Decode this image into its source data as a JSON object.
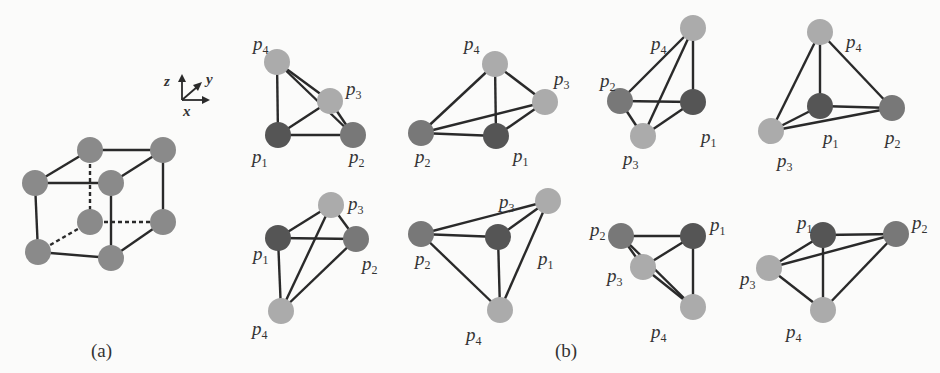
{
  "figure": {
    "panel_a": {
      "caption": "(a)",
      "axes": {
        "z": "z",
        "y": "y",
        "x": "x"
      },
      "cube_nodes": [
        {
          "id": "tbl",
          "x": 90,
          "y": 150
        },
        {
          "id": "tbr",
          "x": 163,
          "y": 150
        },
        {
          "id": "tfl",
          "x": 35,
          "y": 183
        },
        {
          "id": "tfr",
          "x": 111,
          "y": 183
        },
        {
          "id": "mbl",
          "x": 90,
          "y": 222
        },
        {
          "id": "mbr",
          "x": 163,
          "y": 222
        },
        {
          "id": "bfl",
          "x": 38,
          "y": 252
        },
        {
          "id": "bfr",
          "x": 111,
          "y": 258
        }
      ],
      "cube_color": "#8a8a8a"
    },
    "panel_b": {
      "caption": "(b)",
      "label_prefix": "p",
      "colors": {
        "p1": "#555555",
        "p2": "#787878",
        "p3": "#ababab",
        "p4": "#ababab"
      },
      "tetrahedra": [
        {
          "name": "top-1",
          "nodes": {
            "p1": [
              278,
              135
            ],
            "p2": [
              353,
              135
            ],
            "p3": [
              330,
              101
            ],
            "p4": [
              277,
              62
            ]
          },
          "labels": {
            "p1": [
              252,
              163
            ],
            "p2": [
              349,
              163
            ],
            "p3": [
              346,
              95
            ],
            "p4": [
              253,
              50
            ]
          }
        },
        {
          "name": "top-2",
          "nodes": {
            "p1": [
              496,
              136
            ],
            "p2": [
              421,
              133
            ],
            "p3": [
              545,
              102
            ],
            "p4": [
              495,
              64
            ]
          },
          "labels": {
            "p1": [
              513,
              162
            ],
            "p2": [
              415,
              163
            ],
            "p3": [
              554,
              85
            ],
            "p4": [
              464,
              50
            ]
          }
        },
        {
          "name": "top-3",
          "nodes": {
            "p1": [
              693,
              102
            ],
            "p2": [
              620,
              101
            ],
            "p3": [
              643,
              136
            ],
            "p4": [
              693,
              28
            ]
          },
          "labels": {
            "p1": [
              701,
              143
            ],
            "p2": [
              600,
              87
            ],
            "p3": [
              623,
              165
            ],
            "p4": [
              651,
              50
            ]
          }
        },
        {
          "name": "top-4",
          "nodes": {
            "p1": [
              820,
              106
            ],
            "p2": [
              892,
              108
            ],
            "p3": [
              771,
              131
            ],
            "p4": [
              820,
              32
            ]
          },
          "labels": {
            "p1": [
              823,
              144
            ],
            "p2": [
              885,
              144
            ],
            "p3": [
              777,
              167
            ],
            "p4": [
              846,
              48
            ]
          }
        },
        {
          "name": "bottom-1",
          "nodes": {
            "p1": [
              278,
              238
            ],
            "p2": [
              356,
              239
            ],
            "p3": [
              331,
              205
            ],
            "p4": [
              281,
              311
            ]
          },
          "labels": {
            "p1": [
              253,
              260
            ],
            "p2": [
              362,
              270
            ],
            "p3": [
              348,
              210
            ],
            "p4": [
              252,
              335
            ]
          }
        },
        {
          "name": "bottom-2",
          "nodes": {
            "p1": [
              498,
              237
            ],
            "p2": [
              421,
              234
            ],
            "p3": [
              548,
              201
            ],
            "p4": [
              500,
              310
            ]
          },
          "labels": {
            "p1": [
              538,
              265
            ],
            "p2": [
              415,
              265
            ],
            "p3": [
              499,
              208
            ],
            "p4": [
              466,
              341
            ]
          }
        },
        {
          "name": "bottom-3",
          "nodes": {
            "p1": [
              693,
              236
            ],
            "p2": [
              621,
              236
            ],
            "p3": [
              643,
              267
            ],
            "p4": [
              693,
              307
            ]
          },
          "labels": {
            "p1": [
              710,
              231
            ],
            "p2": [
              590,
              236
            ],
            "p3": [
              607,
              282
            ],
            "p4": [
              651,
              338
            ]
          }
        },
        {
          "name": "bottom-4",
          "nodes": {
            "p1": [
              823,
              235
            ],
            "p2": [
              896,
              234
            ],
            "p3": [
              769,
              268
            ],
            "p4": [
              823,
              310
            ]
          },
          "labels": {
            "p1": [
              797,
              229
            ],
            "p2": [
              912,
              229
            ],
            "p3": [
              740,
              285
            ],
            "p4": [
              786,
              338
            ]
          }
        }
      ]
    }
  }
}
